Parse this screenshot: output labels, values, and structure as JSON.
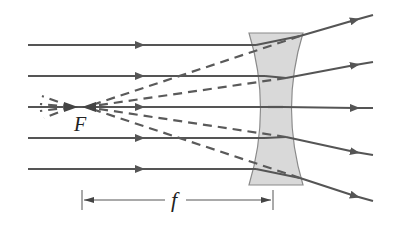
{
  "diagram": {
    "type": "diverging-lens-ray-diagram",
    "focal_point_label": "F",
    "focal_length_label": "f",
    "colors": {
      "ray": "#555555",
      "lens_fill": "#d9d9d9",
      "lens_stroke": "#8a8a8a",
      "background": "#ffffff"
    },
    "incoming_rays": [
      {
        "y": 45,
        "x_start": 28
      },
      {
        "y": 76,
        "x_start": 28
      },
      {
        "y": 107,
        "x_start": 28
      },
      {
        "y": 138,
        "x_start": 28
      },
      {
        "y": 169,
        "x_start": 28
      }
    ],
    "outgoing_rays": [
      {
        "from": [
          300,
          36
        ],
        "to": [
          373,
          15
        ]
      },
      {
        "from": [
          286,
          78
        ],
        "to": [
          373,
          62
        ]
      },
      {
        "from": [
          283,
          107
        ],
        "to": [
          373,
          108
        ]
      },
      {
        "from": [
          286,
          137
        ],
        "to": [
          373,
          155
        ]
      },
      {
        "from": [
          300,
          178
        ],
        "to": [
          373,
          201
        ]
      }
    ],
    "focal_point": {
      "x": 80,
      "y": 107
    },
    "dimension": {
      "x1": 82,
      "x2": 273,
      "y": 200
    }
  }
}
